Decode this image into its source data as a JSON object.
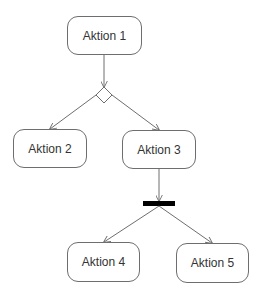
{
  "diagram": {
    "type": "uml-activity",
    "nodes": [
      {
        "id": "a1",
        "label": "Aktion 1",
        "x": 67,
        "y": 16,
        "w": 75,
        "h": 39
      },
      {
        "id": "a2",
        "label": "Aktion 2",
        "x": 13,
        "y": 129,
        "w": 74,
        "h": 39
      },
      {
        "id": "a3",
        "label": "Aktion 3",
        "x": 122,
        "y": 130,
        "w": 74,
        "h": 39
      },
      {
        "id": "a4",
        "label": "Aktion 4",
        "x": 67,
        "y": 242,
        "w": 73,
        "h": 40
      },
      {
        "id": "a5",
        "label": "Aktion 5",
        "x": 176,
        "y": 243,
        "w": 73,
        "h": 40
      }
    ],
    "decision": {
      "id": "d1",
      "shape": "diamond",
      "cx": 104,
      "cy": 95
    },
    "fork": {
      "id": "f1",
      "shape": "bar",
      "x": 143,
      "y": 201,
      "w": 32,
      "h": 5
    },
    "edges": [
      {
        "from": "a1",
        "to": "d1"
      },
      {
        "from": "d1",
        "to": "a2"
      },
      {
        "from": "d1",
        "to": "a3"
      },
      {
        "from": "a3",
        "to": "f1"
      },
      {
        "from": "f1",
        "to": "a4"
      },
      {
        "from": "f1",
        "to": "a5"
      }
    ],
    "colors": {
      "stroke": "#6e6e6e",
      "fork": "#000000",
      "text": "#333333"
    }
  }
}
